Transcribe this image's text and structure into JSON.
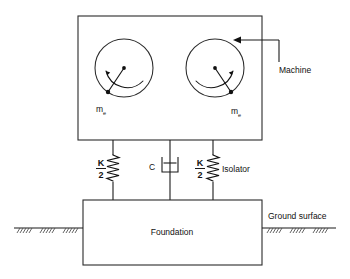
{
  "diagram": {
    "labels": {
      "machine": "Machine",
      "isolator": "Isolator",
      "foundation": "Foundation",
      "ground_surface": "Ground surface",
      "spring_left_numerator": "K",
      "spring_left_denominator": "2",
      "spring_right_numerator": "K",
      "spring_right_denominator": "2",
      "damper": "C",
      "mass_left_symbol": "m",
      "mass_left_subscript": "e",
      "mass_right_symbol": "m",
      "mass_right_subscript": "e"
    },
    "colors": {
      "line": "#1a1a1a",
      "box_outline": "#2b2b2b",
      "background": "#ffffff",
      "hatch": "#4a4a4a"
    },
    "components": [
      {
        "name": "machine-box",
        "kind": "rectangle"
      },
      {
        "name": "rotor-left",
        "kind": "rotating-unbalanced-mass"
      },
      {
        "name": "rotor-right",
        "kind": "rotating-unbalanced-mass"
      },
      {
        "name": "spring-left",
        "kind": "spring",
        "value": "K/2"
      },
      {
        "name": "damper",
        "kind": "dashpot",
        "value": "C"
      },
      {
        "name": "spring-right",
        "kind": "spring",
        "value": "K/2"
      },
      {
        "name": "foundation-box",
        "kind": "rectangle"
      },
      {
        "name": "ground-line",
        "kind": "hatched-ground"
      }
    ]
  }
}
